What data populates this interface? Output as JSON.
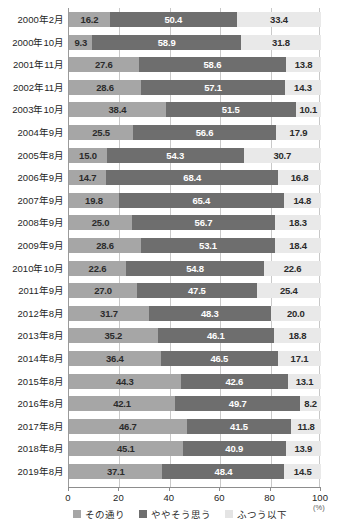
{
  "chart_data": {
    "type": "bar",
    "orientation": "horizontal",
    "stacked": true,
    "title": "",
    "xlabel": "(%)",
    "ylabel": "",
    "xlim": [
      0,
      100
    ],
    "xticks": [
      0,
      20,
      40,
      60,
      80,
      100
    ],
    "xtick_labels": [
      "0",
      "20",
      "40",
      "60",
      "80",
      "100"
    ],
    "grid": true,
    "legend_position": "bottom",
    "categories": [
      "2000年2月",
      "2000年10月",
      "2001年11月",
      "2002年11月",
      "2003年10月",
      "2004年9月",
      "2005年8月",
      "2006年9月",
      "2007年9月",
      "2008年9月",
      "2009年9月",
      "2010年10月",
      "2011年9月",
      "2012年8月",
      "2013年8月",
      "2014年8月",
      "2015年8月",
      "2016年8月",
      "2017年8月",
      "2018年8月",
      "2019年8月"
    ],
    "series": [
      {
        "name": "その通り",
        "color": "#a6a6a6",
        "values": [
          16.2,
          9.3,
          27.6,
          28.6,
          38.4,
          25.5,
          15.0,
          14.7,
          19.8,
          25.0,
          28.6,
          22.6,
          27.0,
          31.7,
          35.2,
          36.4,
          44.3,
          42.1,
          46.7,
          45.1,
          37.1
        ]
      },
      {
        "name": "ややそう思う",
        "color": "#6e6e6e",
        "values": [
          50.4,
          58.9,
          58.6,
          57.1,
          51.5,
          56.6,
          54.3,
          68.4,
          65.4,
          56.7,
          53.1,
          54.8,
          47.5,
          48.3,
          46.1,
          46.5,
          42.6,
          49.7,
          41.5,
          40.9,
          48.4
        ]
      },
      {
        "name": "ふつう以下",
        "color": "#e9e9e9",
        "values": [
          33.4,
          31.8,
          13.8,
          14.3,
          10.1,
          17.9,
          30.7,
          16.8,
          14.8,
          18.3,
          18.4,
          22.6,
          25.4,
          20.0,
          18.8,
          17.1,
          13.1,
          8.2,
          11.8,
          13.9,
          14.5
        ]
      }
    ]
  },
  "axis": {
    "unit": "(%)"
  }
}
